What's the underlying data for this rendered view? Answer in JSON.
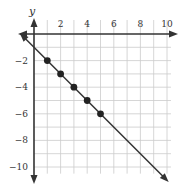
{
  "chart_data": {
    "type": "line",
    "title": "",
    "xlabel": "",
    "ylabel": "y",
    "xlim": [
      -1,
      10.5
    ],
    "ylim": [
      -10.5,
      1
    ],
    "grid": true,
    "x_ticks": [
      2,
      4,
      6,
      8,
      10
    ],
    "y_ticks": [
      -2,
      -4,
      -6,
      -8,
      -10
    ],
    "x_tick_labels": [
      "2",
      "4",
      "6",
      "8",
      "10"
    ],
    "y_tick_labels": [
      "−2",
      "−4",
      "−6",
      "−8",
      "−10"
    ],
    "series": [
      {
        "name": "line",
        "equation": "y = -x - 1",
        "x": [
          1,
          2,
          3,
          4,
          5
        ],
        "y": [
          -2,
          -3,
          -4,
          -5,
          -6
        ],
        "line_extends_from": [
          -1,
          0
        ],
        "line_extends_to": [
          10,
          -11
        ]
      }
    ]
  },
  "colors": {
    "axis": "#333333",
    "grid": "#cccccc",
    "line": "#333333",
    "point": "#222222"
  }
}
